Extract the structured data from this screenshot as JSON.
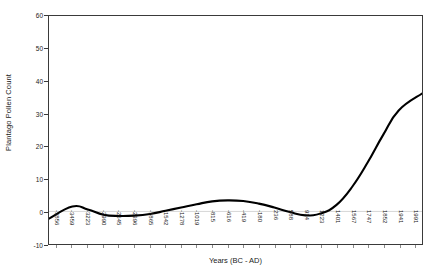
{
  "chart_data": {
    "type": "line",
    "title": "",
    "xlabel": "Years (BC - AD)",
    "ylabel": "Plantago Pollen Count",
    "grid": false,
    "legend": "none",
    "ylim": [
      -10,
      60
    ],
    "yticks": [
      -10,
      0,
      10,
      20,
      30,
      40,
      50,
      60
    ],
    "ytick_labels": [
      "-10",
      "0",
      "10",
      "20",
      "30",
      "40",
      "50",
      "60"
    ],
    "categories": [
      "-3856",
      "-3459",
      "-3223",
      "-2990",
      "-2645",
      "-2396",
      "-1865",
      "-1542",
      "-1278",
      "-1019",
      "-815",
      "-616",
      "-419",
      "-180",
      "236",
      "588",
      "914",
      "1223",
      "1401",
      "1567",
      "1747",
      "1852",
      "1941",
      "1991"
    ],
    "series": [
      {
        "name": "Plantago Pollen Count",
        "color": "#000000",
        "values": [
          -2.2,
          1.5,
          0.6,
          -1.0,
          -1.4,
          -1.3,
          -0.8,
          0.2,
          1.2,
          2.2,
          3.1,
          3.4,
          3.2,
          2.4,
          1.2,
          -0.2,
          -1.2,
          -0.6,
          2.0,
          7.5,
          15.0,
          23.5,
          31.0,
          36.2
        ]
      }
    ]
  },
  "axis": {
    "y_title": "Plantago Pollen Count",
    "x_title": "Years (BC - AD)"
  }
}
